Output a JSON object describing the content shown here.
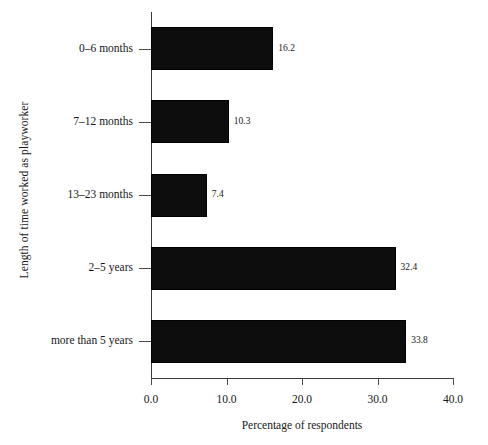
{
  "chart_data": {
    "type": "bar",
    "orientation": "horizontal",
    "title": "",
    "categories": [
      "0–6 months",
      "7–12 months",
      "13–23 months",
      "2–5 years",
      "more than 5 years"
    ],
    "values": [
      16.2,
      10.3,
      7.4,
      32.4,
      33.8
    ],
    "value_labels": [
      "16.2",
      "10.3",
      "7.4",
      "32.4",
      "33.8"
    ],
    "xlabel": "Percentage of respondents",
    "ylabel": "Length of time worked as playworker",
    "xlim": [
      0.0,
      40.0
    ],
    "xticks": [
      0.0,
      10.0,
      20.0,
      30.0,
      40.0
    ],
    "xtick_labels": [
      "0.0",
      "10.0",
      "20.0",
      "30.0",
      "40.0"
    ],
    "grid": false,
    "legend": false,
    "bar_color": "#0d0d0d",
    "axis_color": "#3a3a3a",
    "background": "#ffffff"
  }
}
